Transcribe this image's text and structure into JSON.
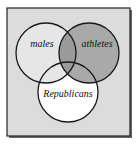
{
  "diagram": {
    "type": "venn",
    "frame": {
      "x": 7,
      "y": 8,
      "width": 123,
      "height": 128,
      "fill": "#dcdcdc",
      "stroke": "#222222"
    },
    "sets": [
      {
        "id": "males",
        "label": "males",
        "cx": 46,
        "cy": 53,
        "r": 30
      },
      {
        "id": "athletes",
        "label": "athletes",
        "cx": 89,
        "cy": 53,
        "r": 30
      },
      {
        "id": "republicans",
        "label": "Republicans",
        "cx": 68,
        "cy": 92,
        "r": 30
      }
    ],
    "colors": {
      "background": "#dcdcdc",
      "males": "#e6e6e6",
      "athletes": "#a9a9a9",
      "republicans": "#ffffff",
      "outline": "#1a1a1a"
    }
  }
}
